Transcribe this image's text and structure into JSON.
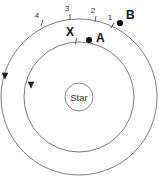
{
  "figure": {
    "background_color": "#ffffff",
    "stroke_color": "#5a5a5a",
    "dot_color": "#111111",
    "width": 159,
    "height": 179
  },
  "center": {
    "label": "Star",
    "cx": 79,
    "cy": 97,
    "r": 14
  },
  "orbits": [
    {
      "name": "inner-orbit",
      "r": 55,
      "direction": "counterclockwise"
    },
    {
      "name": "outer-orbit",
      "r": 78,
      "direction": "counterclockwise"
    }
  ],
  "bodies": [
    {
      "id": "A",
      "label": "A",
      "orbit": "inner-orbit",
      "dot_x": 89,
      "dot_y": 40,
      "label_x": 96,
      "label_y": 42
    },
    {
      "id": "B",
      "label": "B",
      "orbit": "outer-orbit",
      "dot_x": 120,
      "dot_y": 23,
      "label_x": 126,
      "label_y": 19
    }
  ],
  "ticks": [
    {
      "id": "X",
      "label": "X",
      "orbit": "inner-orbit",
      "tick_x1": 76.5,
      "tick_y1": 38,
      "tick_x2": 75.5,
      "tick_y2": 44,
      "label_x": 70,
      "label_y": 36
    },
    {
      "id": "1",
      "label": "1",
      "orbit": "outer-orbit",
      "tick_x1": 114,
      "tick_y1": 23,
      "tick_x2": 111,
      "tick_y2": 28,
      "label_x": 110,
      "label_y": 20
    },
    {
      "id": "2",
      "label": "2",
      "orbit": "outer-orbit",
      "tick_x1": 96,
      "tick_y1": 16,
      "tick_x2": 95,
      "tick_y2": 22,
      "label_x": 93,
      "label_y": 13
    },
    {
      "id": "3",
      "label": "3",
      "orbit": "outer-orbit",
      "tick_x1": 70,
      "tick_y1": 14,
      "tick_x2": 70,
      "tick_y2": 20,
      "label_x": 67,
      "label_y": 11
    },
    {
      "id": "4",
      "label": "4",
      "orbit": "outer-orbit",
      "tick_x1": 43,
      "tick_y1": 20,
      "tick_x2": 41,
      "tick_y2": 26,
      "label_x": 37,
      "label_y": 18
    }
  ],
  "direction_arrows": [
    {
      "name": "outer-orbit-direction-arrow",
      "x": 5,
      "y": 76
    },
    {
      "name": "inner-orbit-direction-arrow",
      "x": 31,
      "y": 85
    }
  ]
}
